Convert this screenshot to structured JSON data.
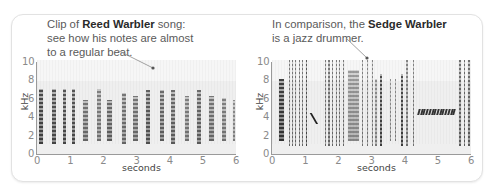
{
  "chart_data": [
    {
      "type": "heatmap",
      "title": "Reed Warbler song spectrogram",
      "annotation": {
        "prefix": "Clip of ",
        "bold": "Reed Warbler",
        "suffix": " song:",
        "line2": "see how his notes are almost",
        "line3": "to a regular beat."
      },
      "xlabel": "seconds",
      "ylabel": "kHz",
      "xlim": [
        0,
        6
      ],
      "ylim": [
        0,
        10
      ],
      "x_ticks": [
        "0",
        "1",
        "2",
        "3",
        "4",
        "5",
        "6"
      ],
      "y_ticks": [
        "0",
        "2",
        "4",
        "6",
        "8",
        "10"
      ],
      "notes": [
        {
          "t": 0.05,
          "w": 0.14,
          "lo": 1.2,
          "hi": 7.0,
          "d": 0.75
        },
        {
          "t": 0.45,
          "w": 0.12,
          "lo": 1.2,
          "hi": 7.0,
          "d": 0.7
        },
        {
          "t": 0.78,
          "w": 0.09,
          "lo": 1.2,
          "hi": 7.0,
          "d": 0.7
        },
        {
          "t": 1.05,
          "w": 0.09,
          "lo": 1.2,
          "hi": 7.0,
          "d": 0.7
        },
        {
          "t": 1.4,
          "w": 0.13,
          "lo": 1.5,
          "hi": 5.8,
          "d": 0.55
        },
        {
          "t": 1.8,
          "w": 0.12,
          "lo": 1.5,
          "hi": 7.0,
          "d": 0.5
        },
        {
          "t": 2.12,
          "w": 0.14,
          "lo": 1.5,
          "hi": 5.8,
          "d": 0.6
        },
        {
          "t": 2.55,
          "w": 0.12,
          "lo": 1.2,
          "hi": 6.5,
          "d": 0.55
        },
        {
          "t": 2.9,
          "w": 0.14,
          "lo": 1.5,
          "hi": 6.2,
          "d": 0.55
        },
        {
          "t": 3.3,
          "w": 0.12,
          "lo": 1.2,
          "hi": 6.8,
          "d": 0.65
        },
        {
          "t": 3.7,
          "w": 0.12,
          "lo": 1.5,
          "hi": 6.8,
          "d": 0.6
        },
        {
          "t": 4.05,
          "w": 0.12,
          "lo": 1.2,
          "hi": 6.8,
          "d": 0.6
        },
        {
          "t": 4.45,
          "w": 0.14,
          "lo": 1.5,
          "hi": 6.2,
          "d": 0.5
        },
        {
          "t": 4.82,
          "w": 0.13,
          "lo": 1.2,
          "hi": 6.8,
          "d": 0.6
        },
        {
          "t": 5.2,
          "w": 0.14,
          "lo": 1.5,
          "hi": 6.2,
          "d": 0.55
        },
        {
          "t": 5.58,
          "w": 0.12,
          "lo": 1.5,
          "hi": 6.0,
          "d": 0.5
        },
        {
          "t": 5.9,
          "w": 0.08,
          "lo": 1.5,
          "hi": 5.8,
          "d": 0.45
        }
      ]
    },
    {
      "type": "heatmap",
      "title": "Sedge Warbler song spectrogram",
      "annotation": {
        "prefix": "In comparison, the ",
        "bold": "Sedge Warbler",
        "suffix": "",
        "line2": "is a jazz drummer.",
        "line3": ""
      },
      "xlabel": "seconds",
      "ylabel": "kHz",
      "xlim": [
        0,
        6
      ],
      "ylim": [
        0,
        10
      ],
      "x_ticks": [
        "0",
        "1",
        "2",
        "3",
        "4",
        "5",
        "6"
      ],
      "y_ticks": [
        "0",
        "2",
        "4",
        "6",
        "8",
        "10"
      ],
      "notes": [
        {
          "t": 0.22,
          "w": 0.14,
          "lo": 1.5,
          "hi": 8.0,
          "d": 0.8
        },
        {
          "t": 0.5,
          "w": 0.03,
          "lo": 1.0,
          "hi": 10.0,
          "d": 0.55
        },
        {
          "t": 0.6,
          "w": 0.03,
          "lo": 1.0,
          "hi": 10.0,
          "d": 0.55
        },
        {
          "t": 0.7,
          "w": 0.03,
          "lo": 1.0,
          "hi": 10.0,
          "d": 0.55
        },
        {
          "t": 0.8,
          "w": 0.03,
          "lo": 1.0,
          "hi": 10.0,
          "d": 0.55
        },
        {
          "t": 0.9,
          "w": 0.03,
          "lo": 1.0,
          "hi": 10.0,
          "d": 0.55
        },
        {
          "t": 1.02,
          "w": 0.05,
          "lo": 1.0,
          "hi": 10.0,
          "d": 0.7
        },
        {
          "t": 1.6,
          "w": 0.03,
          "lo": 1.0,
          "hi": 10.0,
          "d": 0.55
        },
        {
          "t": 1.7,
          "w": 0.03,
          "lo": 1.0,
          "hi": 10.0,
          "d": 0.55
        },
        {
          "t": 1.8,
          "w": 0.03,
          "lo": 1.0,
          "hi": 10.0,
          "d": 0.55
        },
        {
          "t": 1.92,
          "w": 0.03,
          "lo": 1.0,
          "hi": 10.0,
          "d": 0.55
        },
        {
          "t": 2.02,
          "w": 0.03,
          "lo": 1.0,
          "hi": 10.0,
          "d": 0.55
        },
        {
          "t": 2.15,
          "w": 0.03,
          "lo": 1.0,
          "hi": 10.0,
          "d": 0.55
        },
        {
          "t": 2.28,
          "w": 0.35,
          "lo": 1.5,
          "hi": 9.0,
          "d": 0.4
        },
        {
          "t": 2.72,
          "w": 0.03,
          "lo": 1.0,
          "hi": 10.0,
          "d": 0.5
        },
        {
          "t": 2.85,
          "w": 0.03,
          "lo": 1.0,
          "hi": 10.0,
          "d": 0.5
        },
        {
          "t": 3.0,
          "w": 0.03,
          "lo": 1.0,
          "hi": 10.0,
          "d": 0.5
        },
        {
          "t": 3.12,
          "w": 0.03,
          "lo": 1.0,
          "hi": 8.0,
          "d": 0.45
        },
        {
          "t": 3.25,
          "w": 0.08,
          "lo": 1.0,
          "hi": 8.5,
          "d": 0.75
        },
        {
          "t": 3.55,
          "w": 0.03,
          "lo": 1.5,
          "hi": 8.0,
          "d": 0.45
        },
        {
          "t": 3.7,
          "w": 0.03,
          "lo": 1.5,
          "hi": 8.0,
          "d": 0.45
        },
        {
          "t": 3.88,
          "w": 0.08,
          "lo": 1.0,
          "hi": 8.5,
          "d": 0.75
        },
        {
          "t": 4.05,
          "w": 0.03,
          "lo": 1.0,
          "hi": 10.0,
          "d": 0.5
        },
        {
          "t": 4.25,
          "w": 0.03,
          "lo": 1.0,
          "hi": 10.0,
          "d": 0.5
        },
        {
          "t": 5.65,
          "w": 0.03,
          "lo": 1.0,
          "hi": 10.0,
          "d": 0.6
        },
        {
          "t": 5.78,
          "w": 0.03,
          "lo": 1.0,
          "hi": 10.0,
          "d": 0.6
        },
        {
          "t": 5.92,
          "w": 0.03,
          "lo": 1.0,
          "hi": 10.0,
          "d": 0.6
        }
      ],
      "trill": {
        "t_start": 4.4,
        "t_end": 5.55,
        "lo": 4.2,
        "hi": 4.8,
        "count": 14
      },
      "slur": {
        "t": 1.25,
        "from_khz": 4.4,
        "to_khz": 3.2
      }
    }
  ],
  "colors": {
    "panel_border": "#e2e2e2",
    "plot_bg": "#efefef",
    "note_ink": "#222222",
    "axis": "#9a9a9a",
    "tick_text": "#8a8a8a",
    "caption_text": "#5a5a5a"
  }
}
